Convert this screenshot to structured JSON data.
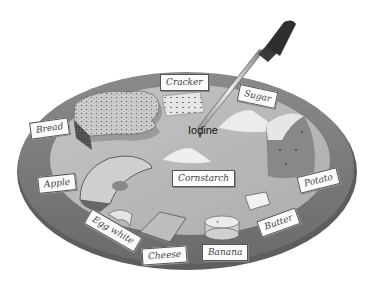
{
  "figure": {
    "reagent_label": "Iodine",
    "colors": {
      "background": "#ffffff",
      "plate_rim": "#7c7c7c",
      "plate_rim_shadow": "#5e5e5e",
      "plate_surface": "#b9b9b9",
      "label_fill": "#fbfbfb",
      "label_text": "#444444"
    },
    "food_labels": [
      {
        "id": "bread",
        "text": "Bread"
      },
      {
        "id": "cracker",
        "text": "Cracker"
      },
      {
        "id": "sugar",
        "text": "Sugar"
      },
      {
        "id": "apple",
        "text": "Apple"
      },
      {
        "id": "cornstarch",
        "text": "Cornstarch"
      },
      {
        "id": "potato",
        "text": "Potato"
      },
      {
        "id": "egg_white",
        "text": "Egg white"
      },
      {
        "id": "cheese",
        "text": "Cheese"
      },
      {
        "id": "banana",
        "text": "Banana"
      },
      {
        "id": "butter",
        "text": "Butter"
      }
    ],
    "objects": [
      "plate",
      "dropper",
      "iodine-drop",
      "bread-slice",
      "cracker",
      "sugar-pile",
      "cornstarch-pile",
      "apple-slice",
      "potato-wedge",
      "egg-white-piece",
      "cheese-slice",
      "banana-slice",
      "butter-pat"
    ]
  }
}
